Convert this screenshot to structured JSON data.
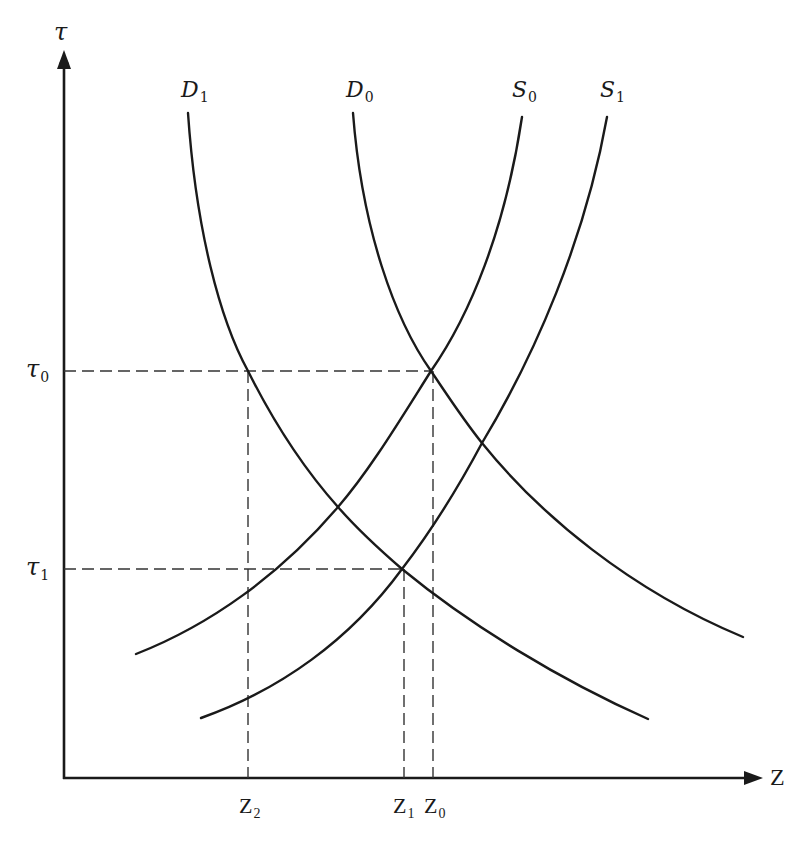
{
  "diagram": {
    "title": "",
    "axes": {
      "y_label": "τ",
      "x_label": "Z"
    },
    "curves": [
      {
        "id": "D1",
        "base": "D",
        "sub": "1",
        "type": "demand"
      },
      {
        "id": "D0",
        "base": "D",
        "sub": "0",
        "type": "demand"
      },
      {
        "id": "S0",
        "base": "S",
        "sub": "0",
        "type": "supply"
      },
      {
        "id": "S1",
        "base": "S",
        "sub": "1",
        "type": "supply"
      }
    ],
    "y_ticks": [
      {
        "base": "τ",
        "sub": "0"
      },
      {
        "base": "τ",
        "sub": "1"
      }
    ],
    "x_ticks": [
      {
        "base": "Z",
        "sub": "2"
      },
      {
        "base": "Z",
        "sub": "1"
      },
      {
        "base": "Z",
        "sub": "0"
      }
    ],
    "colors": {
      "line": "#1a1a1a",
      "dashed": "#333333",
      "background": "#ffffff"
    }
  }
}
